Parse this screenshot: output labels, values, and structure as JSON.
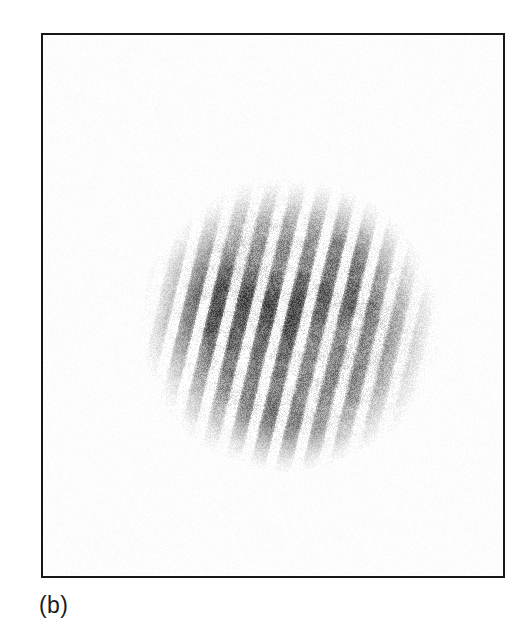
{
  "figure": {
    "panel_label": "(b)",
    "background_color": "#ffffff",
    "frame": {
      "x": 41,
      "y": 33,
      "width": 464,
      "height": 545,
      "border_color": "#171717",
      "border_width": 2.5
    },
    "caption_color": "#1b1b1b"
  },
  "chart_data": {
    "type": "heatmap",
    "title": "",
    "subtitle": "",
    "xlabel": "",
    "ylabel": "",
    "annotations": [
      "(b)"
    ],
    "legend": [],
    "grid": false,
    "pattern": {
      "kind": "linear-fringes-in-disc",
      "center_x": 290,
      "center_y": 325,
      "radius": 146,
      "radius_x": 146,
      "radius_y": 144,
      "fringe_period_px": 25.5,
      "fringe_tilt_deg": 13.5,
      "fringe_count_visible": 13,
      "dark_gray": "#8a8a8a",
      "deep_gray": "#6f6f6f",
      "light_gray": "#c9c9c9",
      "white": "#ffffff",
      "edge_falloff": 0.42,
      "grain_amplitude": 58,
      "grain_scale": 1.35,
      "phase_offset_px": 5
    },
    "axis_ranges": {
      "x": [
        41,
        505
      ],
      "y": [
        33,
        578
      ]
    }
  }
}
